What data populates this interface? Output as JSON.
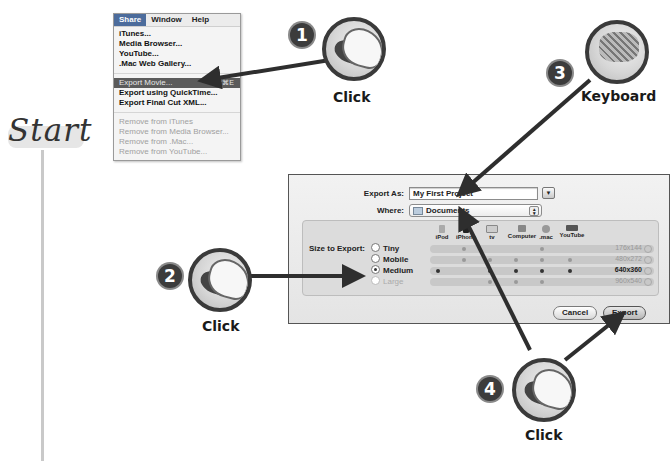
{
  "start": {
    "label": "Start"
  },
  "menu": {
    "menubar": [
      "Share",
      "Window",
      "Help"
    ],
    "active_menu": "Share",
    "items": [
      {
        "label": "iTunes...",
        "state": "enabled"
      },
      {
        "label": "Media Browser...",
        "state": "enabled"
      },
      {
        "label": "YouTube...",
        "state": "enabled"
      },
      {
        "label": ".Mac Web Gallery...",
        "state": "enabled"
      },
      {
        "label": "Export Movie...",
        "state": "selected",
        "shortcut": "⌘E"
      },
      {
        "label": "Export using QuickTime...",
        "state": "enabled"
      },
      {
        "label": "Export Final Cut XML...",
        "state": "enabled"
      },
      {
        "label": "Remove from iTunes",
        "state": "disabled"
      },
      {
        "label": "Remove from Media Browser...",
        "state": "disabled"
      },
      {
        "label": "Remove from .Mac...",
        "state": "disabled"
      },
      {
        "label": "Remove from YouTube...",
        "state": "disabled"
      }
    ]
  },
  "steps": [
    {
      "number": "1",
      "action": "Click",
      "icon": "mouse-click-icon"
    },
    {
      "number": "2",
      "action": "Click",
      "icon": "mouse-click-icon"
    },
    {
      "number": "3",
      "action": "Keyboard",
      "icon": "keyboard-icon"
    },
    {
      "number": "4",
      "action": "Click",
      "icon": "mouse-click-icon"
    }
  ],
  "dialog": {
    "export_as_label": "Export As:",
    "export_as_value": "My First Project",
    "where_label": "Where:",
    "where_value": "Documents",
    "size_label": "Size to Export:",
    "devices": [
      "iPod",
      "iPhone",
      "tv",
      "Computer",
      ".mac",
      "YouTube"
    ],
    "sizes": [
      {
        "label": "Tiny",
        "resolution": "176x144",
        "checked": false,
        "disabled": false,
        "dots": [
          1,
          4
        ]
      },
      {
        "label": "Mobile",
        "resolution": "480x272",
        "checked": false,
        "disabled": false,
        "dots": [
          1,
          2,
          3,
          4,
          5
        ]
      },
      {
        "label": "Medium",
        "resolution": "640x360",
        "checked": true,
        "disabled": false,
        "dots": [
          0,
          2,
          3,
          4,
          5
        ]
      },
      {
        "label": "Large",
        "resolution": "960x540",
        "checked": false,
        "disabled": true,
        "dots": [
          2,
          3,
          4
        ]
      }
    ],
    "cancel_label": "Cancel",
    "export_label": "Export"
  }
}
